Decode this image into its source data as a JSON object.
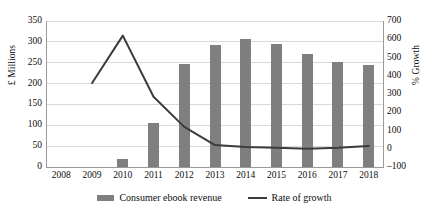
{
  "chart_data": {
    "type": "bar",
    "title": "",
    "xlabel": "",
    "ylabel": "£ Millions",
    "y2label": "% Growth",
    "categories": [
      "2008",
      "2009",
      "2010",
      "2011",
      "2012",
      "2013",
      "2014",
      "2015",
      "2016",
      "2017",
      "2018"
    ],
    "grid": true,
    "legend_position": "bottom",
    "ylim": [
      0,
      350
    ],
    "y_ticks": [
      0,
      50,
      100,
      150,
      200,
      250,
      300,
      350
    ],
    "y2lim": [
      -100,
      700
    ],
    "y2_ticks": [
      -100,
      0,
      100,
      200,
      300,
      400,
      500,
      600,
      700
    ],
    "series": [
      {
        "name": "Consumer ebook revenue",
        "type": "bar",
        "axis": "left",
        "unit": "£ Millions",
        "color": "#7f7f7f",
        "values": [
          0,
          0,
          20,
          105,
          247,
          292,
          308,
          295,
          270,
          252,
          245
        ]
      },
      {
        "name": "Rate of growth",
        "type": "line",
        "axis": "right",
        "unit": "% Growth",
        "color": "#3b3b3b",
        "values": [
          null,
          360,
          620,
          285,
          120,
          20,
          10,
          5,
          0,
          5,
          15
        ]
      }
    ]
  },
  "axes": {
    "left": {
      "title": "£ Millions",
      "tick_labels": [
        "350",
        "300",
        "250",
        "200",
        "150",
        "100",
        "50",
        "0"
      ]
    },
    "right": {
      "title": "% Growth",
      "tick_labels": [
        "700",
        "600",
        "500",
        "400",
        "300",
        "200",
        "100",
        "0",
        "–100"
      ]
    },
    "bottom": {
      "tick_labels": [
        "2008",
        "2009",
        "2010",
        "2011",
        "2012",
        "2013",
        "2014",
        "2015",
        "2016",
        "2017",
        "2018"
      ]
    }
  },
  "legend": {
    "items": [
      {
        "label": "Consumer ebook revenue",
        "marker": "bar-swatch-icon",
        "color": "#7f7f7f"
      },
      {
        "label": "Rate of growth",
        "marker": "line-swatch-icon",
        "color": "#3b3b3b"
      }
    ]
  },
  "colors": {
    "bar": "#7f7f7f",
    "line": "#3b3b3b",
    "grid": "#d9d9d9",
    "axis": "#9a9a9a",
    "text": "#0d0d0d",
    "background": "#ffffff"
  }
}
